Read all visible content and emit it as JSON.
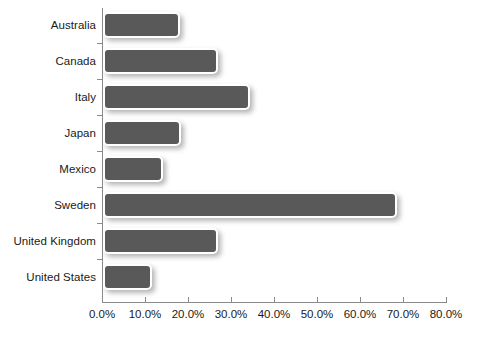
{
  "chart_data": {
    "type": "bar",
    "orientation": "horizontal",
    "title": "",
    "subtitle": "",
    "xlabel": "",
    "ylabel": "",
    "categories": [
      "Australia",
      "Canada",
      "Italy",
      "Japan",
      "Mexico",
      "Sweden",
      "United Kingdom",
      "United States"
    ],
    "values": [
      18.0,
      27.0,
      34.4,
      18.2,
      14.0,
      68.8,
      27.0,
      11.5
    ],
    "value_format": "percent",
    "xlim": [
      0,
      80
    ],
    "xtick_labels": [
      "0.0%",
      "10.0%",
      "20.0%",
      "30.0%",
      "40.0%",
      "50.0%",
      "60.0%",
      "70.0%",
      "80.0%"
    ],
    "xtick_values": [
      0,
      10,
      20,
      30,
      40,
      50,
      60,
      70,
      80
    ],
    "grid": false,
    "legend": false,
    "legend_position": "none",
    "series": [
      {
        "name": "",
        "values": [
          18.0,
          27.0,
          34.4,
          18.2,
          14.0,
          68.8,
          27.0,
          11.5
        ]
      }
    ],
    "colors": {
      "bar_fill": "#595959",
      "bar_border": "#ffffff",
      "axis": "#8a8a8a",
      "text": "#1a1a1a",
      "background": "#ffffff"
    }
  }
}
